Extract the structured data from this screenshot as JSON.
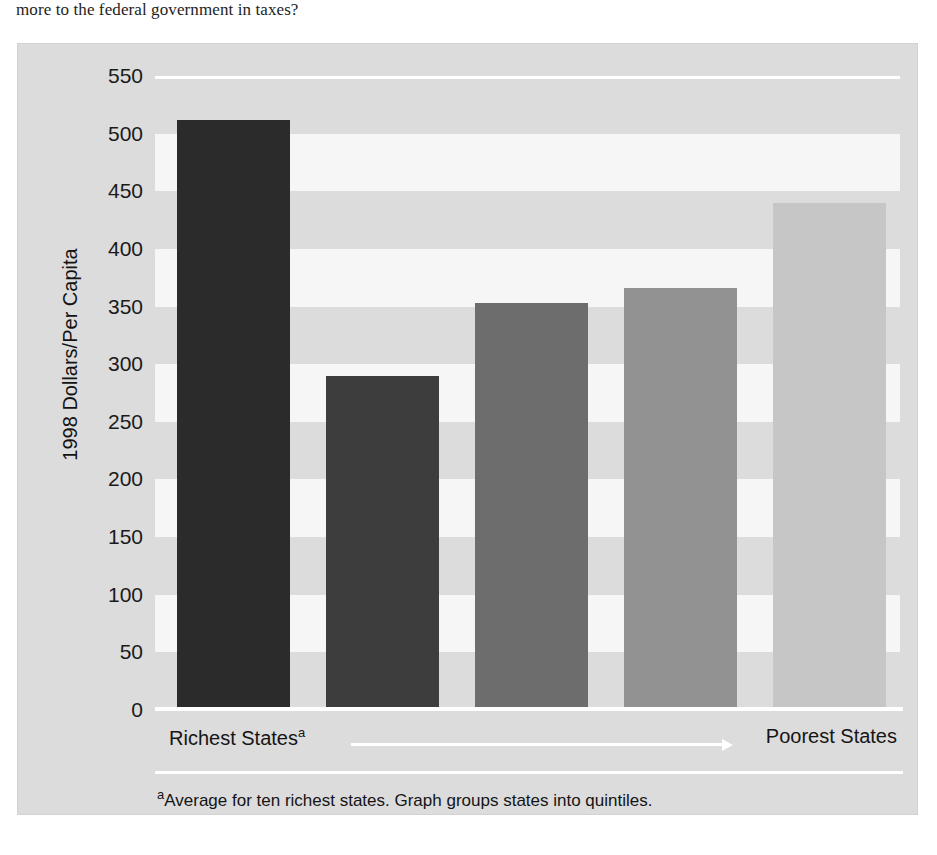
{
  "caption": {
    "text": "more to the federal government in taxes?"
  },
  "chart_data": {
    "type": "bar",
    "title": "",
    "subtitle": "",
    "xlabel": "",
    "ylabel": "1998 Dollars/Per Capita",
    "ylim": [
      0,
      550
    ],
    "grid": true,
    "legend": "none",
    "categories": [
      "Quintile 1",
      "Quintile 2",
      "Quintile 3",
      "Quintile 4",
      "Quintile 5"
    ],
    "values": [
      512,
      290,
      353,
      366,
      440
    ],
    "bar_colors": [
      "#2b2b2b",
      "#3d3d3d",
      "#6d6d6d",
      "#929292",
      "#c6c6c6"
    ],
    "yticks": [
      "550",
      "500",
      "450",
      "400",
      "350",
      "300",
      "250",
      "200",
      "150",
      "100",
      "50",
      "0"
    ],
    "ytick_values": [
      550,
      500,
      450,
      400,
      350,
      300,
      250,
      200,
      150,
      100,
      50,
      0
    ],
    "x_axis_left_label": "Richest States",
    "x_axis_left_footmark": "a",
    "x_axis_right_label": "Poorest States",
    "annotations": [
      "Arrow pointing from Richest States to Poorest States"
    ],
    "footnote_mark": "a",
    "footnote_text": "Average for ten richest states. Graph groups states into quintiles."
  },
  "colors": {
    "panel_background": "#dcdcdc",
    "band_light": "#f6f6f6",
    "gridline": "#ffffff",
    "text": "#141414"
  }
}
